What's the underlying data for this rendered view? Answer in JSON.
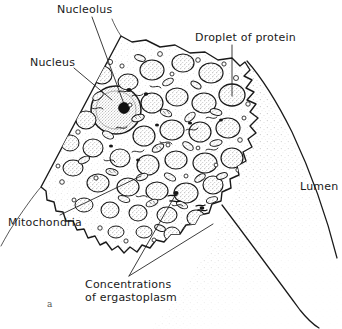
{
  "figure": {
    "marker": "a",
    "background_color": "#ffffff",
    "ink_color": "#1a1a1a",
    "type": "histology-line-drawing"
  },
  "labels": {
    "nucleolus": "Nucleolus",
    "nucleus": "Nucleus",
    "droplet_of_protein": "Droplet of protein",
    "lumen": "Lumen",
    "mitochondria": "Mitochondria",
    "concentrations_of_ergastoplasm": "Concentrations\nof ergastoplasm"
  },
  "structures": [
    {
      "name": "nucleolus",
      "description": "dark round body inside nucleus"
    },
    {
      "name": "nucleus",
      "description": "large stippled round body, left of centre"
    },
    {
      "name": "droplet-of-protein",
      "description": "zymogen granule near apical surface"
    },
    {
      "name": "lumen",
      "description": "stippled open space at lower right"
    },
    {
      "name": "mitochondria",
      "description": "small rod and oval bodies in cytoplasm"
    },
    {
      "name": "ergastoplasm",
      "description": "dense basophilic concentrations in cytoplasm"
    }
  ]
}
